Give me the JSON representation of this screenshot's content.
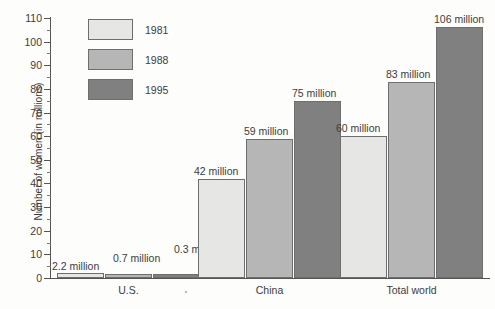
{
  "chart_data": {
    "type": "bar",
    "title": "",
    "subtitle": "",
    "xlabel": "",
    "ylabel": "Number of women (in millions)",
    "ylim": [
      0,
      110
    ],
    "ytick_step": 10,
    "yminor_step": 5,
    "grid": false,
    "legend_position": "top-left",
    "categories": [
      "U.S.",
      "China",
      "Total world"
    ],
    "series": [
      {
        "name": "1981",
        "color": "#e6e6e4",
        "values": [
          2.2,
          42,
          60
        ],
        "labels": [
          "2.2 million",
          "42 million",
          "60 million"
        ]
      },
      {
        "name": "1988",
        "color": "#b6b6b6",
        "values": [
          0.7,
          59,
          83
        ],
        "labels": [
          "0.7 million",
          "59 million",
          "83 million"
        ]
      },
      {
        "name": "1995",
        "color": "#808080",
        "values": [
          0.3,
          75,
          106
        ],
        "labels": [
          "0.3 million",
          "75 million",
          "106 million"
        ]
      }
    ],
    "ytick_labels": [
      "0",
      "10",
      "20",
      "30",
      "40",
      "50",
      "60",
      "70",
      "80",
      "90",
      "100",
      "110"
    ],
    "annotations": [
      "2.2 million",
      "0.7 million",
      "0.3 million",
      "42 million",
      "59 million",
      "75 million",
      "60 million",
      "83 million",
      "106 million"
    ]
  },
  "axis": {
    "y_title": "Number of women (in millions)",
    "ticks": [
      {
        "value": "110"
      },
      {
        "value": "100"
      },
      {
        "value": "90"
      },
      {
        "value": "80"
      },
      {
        "value": "70"
      },
      {
        "value": "60"
      },
      {
        "value": "50"
      },
      {
        "value": "40"
      },
      {
        "value": "30"
      },
      {
        "value": "20"
      },
      {
        "value": "10"
      },
      {
        "value": "0"
      }
    ]
  },
  "legend": {
    "items": [
      {
        "label": "1981",
        "color": "#e6e6e4"
      },
      {
        "label": "1988",
        "color": "#b6b6b6"
      },
      {
        "label": "1995",
        "color": "#808080"
      }
    ]
  },
  "groups": [
    {
      "label": "U.S.",
      "bars": [
        {
          "series": "1981",
          "value": 2.2,
          "label": "2.2 million"
        },
        {
          "series": "1988",
          "value": 0.7,
          "label": "0.7 million"
        },
        {
          "series": "1995",
          "value": 0.3,
          "label": "0.3 million"
        }
      ]
    },
    {
      "label": "China",
      "bars": [
        {
          "series": "1981",
          "value": 42,
          "label": "42 million"
        },
        {
          "series": "1988",
          "value": 59,
          "label": "59 million"
        },
        {
          "series": "1995",
          "value": 75,
          "label": "75 million"
        }
      ]
    },
    {
      "label": "Total world",
      "bars": [
        {
          "series": "1981",
          "value": 60,
          "label": "60 million"
        },
        {
          "series": "1988",
          "value": 83,
          "label": "83 million"
        },
        {
          "series": "1995",
          "value": 106,
          "label": "106 million"
        }
      ]
    }
  ]
}
